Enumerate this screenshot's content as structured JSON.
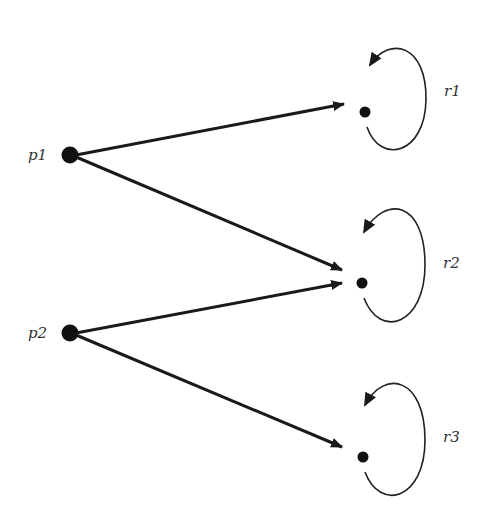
{
  "diagram": {
    "type": "directed-graph",
    "colors": {
      "edge": "#1a1a1a",
      "node": "#111111",
      "loop": "#222222",
      "label": "#333333",
      "background": "#ffffff"
    },
    "nodes": [
      {
        "id": "p1",
        "label": "p1",
        "x": 70,
        "y": 155,
        "label_x": 28,
        "label_y": 160
      },
      {
        "id": "p2",
        "label": "p2",
        "x": 70,
        "y": 333,
        "label_x": 28,
        "label_y": 338
      },
      {
        "id": "r1",
        "label": "r1",
        "x": 365,
        "y": 112,
        "label_x": 444,
        "label_y": 96
      },
      {
        "id": "r2",
        "label": "r2",
        "x": 362,
        "y": 283,
        "label_x": 443,
        "label_y": 268
      },
      {
        "id": "r3",
        "label": "r3",
        "x": 363,
        "y": 457,
        "label_x": 443,
        "label_y": 442
      }
    ],
    "edges": [
      {
        "from": "p1",
        "to": "r1"
      },
      {
        "from": "p1",
        "to": "r2"
      },
      {
        "from": "p2",
        "to": "r2"
      },
      {
        "from": "p2",
        "to": "r3"
      }
    ],
    "self_loops": [
      {
        "node": "r1"
      },
      {
        "node": "r2"
      },
      {
        "node": "r3"
      }
    ]
  }
}
